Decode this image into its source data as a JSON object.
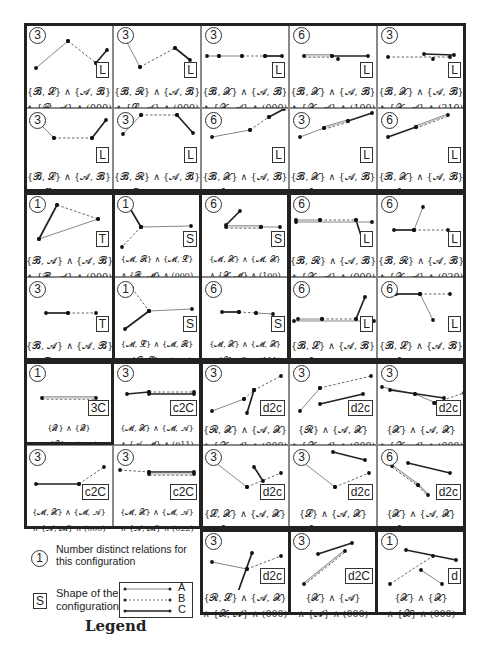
{
  "figure": {
    "cells": [
      {
        "id": "r1c1",
        "num": "3",
        "shape": "L",
        "f1": "{𝓑, 𝓛} ∧ {𝓐, 𝓑}",
        "f2": "∧ {𝓡, 𝓐} ∧ (000)"
      },
      {
        "id": "r1c2",
        "num": "3",
        "shape": "L",
        "f1": "{𝓑, 𝓡} ∧ {𝓐, 𝓑}",
        "f2": "∧ {𝓛, 𝓐} ∧ (000)"
      },
      {
        "id": "r1c3",
        "num": "3",
        "shape": "L",
        "f1": "{𝓑, 𝓧} ∧ {𝓐, 𝓑}",
        "f2": "∧ {𝓧, 𝓐} ∧ (000)"
      },
      {
        "id": "r1c4",
        "num": "6",
        "shape": "L",
        "f1": "{𝓑, 𝓧} ∧ {𝓐, 𝓑}",
        "f2": "∧ {𝓧, 𝓐} ∧ (100)"
      },
      {
        "id": "r1c5",
        "num": "3",
        "shape": "L",
        "f1": "{𝓑, 𝓧} ∧ {𝓐, 𝓑}",
        "f2": "∧ {𝓧, 𝓐} ∧ (210)"
      },
      {
        "id": "r2c1",
        "num": "3",
        "shape": "L",
        "f1": "{𝓑, 𝓛} ∧ {𝓐, 𝓑}",
        "f2": "∧ {𝓛, 𝓐} ∧ (000)"
      },
      {
        "id": "r2c2",
        "num": "3",
        "shape": "L",
        "f1": "{𝓑, 𝓡} ∧ {𝓐, 𝓑}",
        "f2": "∧ {𝓡, 𝓐} ∧ (000)"
      },
      {
        "id": "r2c3",
        "num": "6",
        "shape": "L",
        "f1": "{𝓑, 𝓧} ∧ {𝓐, 𝓑}",
        "f2": "∧ {𝓧, 𝓐} ∧ (010)"
      },
      {
        "id": "r2c4",
        "num": "3",
        "shape": "L",
        "f1": "{𝓑, 𝓧} ∧ {𝓐, 𝓑}",
        "f2": "∧ {𝓧, 𝓐} ∧ (120)"
      },
      {
        "id": "r2c5",
        "num": "6",
        "shape": "L",
        "f1": "{𝓑, 𝓧} ∧ {𝓐, 𝓑}",
        "f2": "∧ {𝓧, 𝓐} ∧ (220)"
      },
      {
        "id": "r3c1",
        "num": "1",
        "shape": "T",
        "f1": "{𝓑, 𝓐} ∧ {𝓐, 𝓑}",
        "f2": "∧ {𝓑, 𝓐} ∧ (000)"
      },
      {
        "id": "r3c2",
        "num": "1",
        "shape": "S",
        "f1": "{𝓜, 𝓡} ∧ {𝓜, 𝓛}",
        "f2": "∧ {𝓡, 𝓜} ∧ (000)"
      },
      {
        "id": "r3c3",
        "num": "6",
        "shape": "S",
        "f1": "{𝓜, 𝓧} ∧ {𝓜, 𝓧}",
        "f2": "∧ {𝓧, 𝓜} ∧ (100)"
      },
      {
        "id": "r3c4",
        "num": "6",
        "shape": "L",
        "f1": "{𝓑, 𝓡} ∧ {𝓐, 𝓑}",
        "f2": "∧ {𝓧, 𝓐} ∧ (000)"
      },
      {
        "id": "r3c5",
        "num": "6",
        "shape": "L",
        "f1": "{𝓑, 𝓡} ∧ {𝓐, 𝓑}",
        "f2": "∧ {𝓧, 𝓐} ∧ (020)"
      },
      {
        "id": "r4c1",
        "num": "3",
        "shape": "T",
        "f1": "{𝓑, 𝓐} ∧ {𝓐, 𝓑}",
        "f2": "∧ {𝓑, 𝓐} ∧ (101)"
      },
      {
        "id": "r4c2",
        "num": "1",
        "shape": "S",
        "f1": "{𝓜, 𝓛} ∧ {𝓜, 𝓡}",
        "f2": "∧ {𝓡, 𝓛} ∧ (000)"
      },
      {
        "id": "r4c3",
        "num": "6",
        "shape": "S",
        "f1": "{𝓜, 𝓧} ∧ {𝓜, 𝓧}",
        "f2": "∧ {𝓧, 𝓜} ∧ (111)"
      },
      {
        "id": "r4c4",
        "num": "6",
        "shape": "L",
        "f1": "{𝓑, 𝓛} ∧ {𝓐, 𝓑}",
        "f2": "∧ {𝓧, 𝓐} ∧ (000)"
      },
      {
        "id": "r4c5",
        "num": "6",
        "shape": "L",
        "f1": "{𝓑, 𝓛} ∧ {𝓐, 𝓑}",
        "f2": "∧ {𝓧, 𝓐} ∧ (020)"
      },
      {
        "id": "r5c1",
        "num": "1",
        "shape": "3C",
        "f1": "{𝓠} ∧ {𝓠}",
        "f2": "∧ {𝓠} ∧ (000)"
      },
      {
        "id": "r5c2",
        "num": "3",
        "shape": "c2C",
        "f1": "{𝓜, 𝓧} ∧ {𝓜, 𝓐}",
        "f2": "∧ {𝓐, 𝓜} ∧ (011)"
      },
      {
        "id": "r5c3",
        "num": "3",
        "shape": "d2c",
        "f1": "{𝓡, 𝓧} ∧ {𝓐, 𝓧}",
        "f2": "∧ {𝓧, 𝓐} ∧ (000)"
      },
      {
        "id": "r5c4",
        "num": "3",
        "shape": "d2c",
        "f1": "{𝓡} ∧ {𝓐, 𝓧}",
        "f2": "∧ {𝓧, 𝓐} ∧ (000)"
      },
      {
        "id": "r5c5",
        "num": "3",
        "shape": "d2c",
        "f1": "{𝓧} ∧ {𝓐, 𝓧}",
        "f2": "∧ {𝓧, 𝓐} ∧ (000)"
      },
      {
        "id": "r6c1",
        "num": "3",
        "shape": "c2C",
        "f1": "{𝓜, 𝓧} ∧ {𝓜, 𝓐}",
        "f2": "∧ {𝓐, 𝓜} ∧ (000)"
      },
      {
        "id": "r6c2",
        "num": "3",
        "shape": "c2C",
        "f1": "{𝓜, 𝓧} ∧ {𝓜, 𝓐}",
        "f2": "∧ {𝓐, 𝓜} ∧ (022)"
      },
      {
        "id": "r6c3",
        "num": "3",
        "shape": "d2c",
        "f1": "{𝓛, 𝓧} ∧ {𝓐, 𝓧}",
        "f2": "∧ {𝓧, 𝓐} ∧ (000)"
      },
      {
        "id": "r6c4",
        "num": "3",
        "shape": "d2c",
        "f1": "{𝓛} ∧ {𝓐, 𝓧}",
        "f2": "∧ {𝓧, 𝓐} ∧ (000)"
      },
      {
        "id": "r6c5",
        "num": "6",
        "shape": "d2c",
        "f1": "{𝓧} ∧ {𝓐, 𝓧}",
        "f2": "∧ {𝓧, 𝓐} ∧ (100)"
      },
      {
        "id": "r7c3",
        "num": "3",
        "shape": "d2c",
        "f1": "{𝓡, 𝓛} ∧ {𝓐, 𝓧}",
        "f2": "∧ {𝓧, 𝓐} ∧ (000)"
      },
      {
        "id": "r7c4",
        "num": "3",
        "shape": "d2C",
        "f1": "{𝓧} ∧ {𝓐}",
        "f2": "∧ {𝓐} ∧ (000)"
      },
      {
        "id": "r7c5",
        "num": "1",
        "shape": "d",
        "f1": "{𝓧} ∧ {𝓧}",
        "f2": "∧ {𝓧} ∧ (000)"
      }
    ]
  },
  "legend": {
    "title": "Legend",
    "num_example": "1",
    "num_desc_1": "Number distinct relations for",
    "num_desc_2": "this configuration",
    "shape_example": "S",
    "shape_desc_1": "Shape of the",
    "shape_desc_2": "configuration",
    "line_types": [
      {
        "label": "A",
        "style": "thin solid"
      },
      {
        "label": "B",
        "style": "dashed"
      },
      {
        "label": "C",
        "style": "thick solid"
      }
    ]
  }
}
